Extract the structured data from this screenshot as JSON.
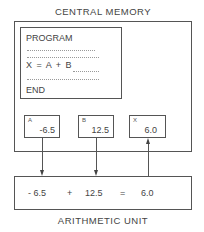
{
  "memory": {
    "title": "CENTRAL MEMORY",
    "program": {
      "header": "PROGRAM",
      "statement": "X = A + B",
      "footer": "END"
    },
    "registers": [
      {
        "name": "A",
        "value": "-6.5"
      },
      {
        "name": "B",
        "value": "12.5"
      },
      {
        "name": "X",
        "value": "6.0"
      }
    ]
  },
  "arithmetic": {
    "title": "ARITHMETIC UNIT",
    "operand1": "- 6.5",
    "operator": "+",
    "operand2": "12.5",
    "equals": "=",
    "result": "6.0"
  }
}
